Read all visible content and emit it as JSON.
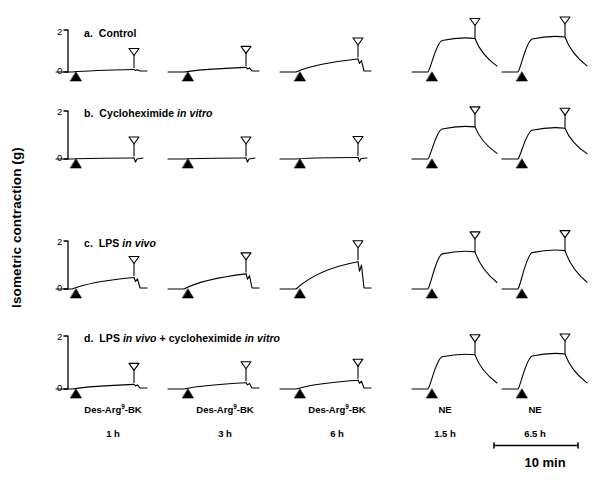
{
  "figure": {
    "axis_label": "Isometric contraction (g)",
    "axis_ticks": [
      "2",
      "0"
    ],
    "scale_bar_label": "10 min",
    "panels": [
      {
        "id": "a",
        "title_prefix": "a.",
        "title": "Control",
        "title_html": "a. &nbsp;Control"
      },
      {
        "id": "b",
        "title_prefix": "b.",
        "title": "Cycloheximide in vitro",
        "title_html": "b. &nbsp;Cycloheximide <span class=\"it\">in vitro</span>"
      },
      {
        "id": "c",
        "title_prefix": "c.",
        "title": "LPS in vivo",
        "title_html": "c. &nbsp;LPS <span class=\"it\">in vivo</span>"
      },
      {
        "id": "d",
        "title_prefix": "d.",
        "title": "LPS in vivo + cycloheximide in vitro",
        "title_html": "d. &nbsp;LPS <span class=\"it\">in vivo</span> + cycloheximide <span class=\"it\">in vitro</span>"
      }
    ],
    "columns": [
      {
        "agonist": "Des-Arg9-BK",
        "agonist_html": "Des-Arg<sup>9</sup>-BK",
        "time": "1 h"
      },
      {
        "agonist": "Des-Arg9-BK",
        "agonist_html": "Des-Arg<sup>9</sup>-BK",
        "time": "3 h"
      },
      {
        "agonist": "Des-Arg9-BK",
        "agonist_html": "Des-Arg<sup>9</sup>-BK",
        "time": "6 h"
      },
      {
        "agonist": "NE",
        "agonist_html": "NE",
        "time": "1.5 h"
      },
      {
        "agonist": "NE",
        "agonist_html": "NE",
        "time": "6.5 h"
      }
    ],
    "markers": {
      "addition": "filled-triangle-up",
      "washout": "open-triangle-down"
    },
    "trace_color": "#000000"
  },
  "chart_data": {
    "type": "line",
    "title": "",
    "ylabel": "Isometric contraction (g)",
    "xlabel": "",
    "ylim": [
      0,
      2
    ],
    "yticks": [
      0,
      2
    ],
    "grid": false,
    "legend": "none",
    "scale_bar": {
      "label": "10 min",
      "axis": "x"
    },
    "row_labels": [
      "a. Control",
      "b. Cycloheximide in vitro",
      "c. LPS in vivo",
      "d. LPS in vivo + cycloheximide in vitro"
    ],
    "column_labels": [
      "Des-Arg9-BK 1 h",
      "Des-Arg9-BK 3 h",
      "Des-Arg9-BK 6 h",
      "NE 1.5 h",
      "NE 6.5 h"
    ],
    "panels": [
      {
        "row": "a. Control",
        "traces": [
          {
            "column": "Des-Arg9-BK 1 h",
            "peak_g": 0.12,
            "shape": "slow-small-rise"
          },
          {
            "column": "Des-Arg9-BK 3 h",
            "peak_g": 0.22,
            "shape": "slow-small-rise"
          },
          {
            "column": "Des-Arg9-BK 6 h",
            "peak_g": 0.62,
            "shape": "slow-rise"
          },
          {
            "column": "NE 1.5 h",
            "peak_g": 1.55,
            "shape": "fast-rise-plateau-decay"
          },
          {
            "column": "NE 6.5 h",
            "peak_g": 1.62,
            "shape": "fast-rise-plateau-decay"
          }
        ]
      },
      {
        "row": "b. Cycloheximide in vitro",
        "traces": [
          {
            "column": "Des-Arg9-BK 1 h",
            "peak_g": 0.05,
            "shape": "flat"
          },
          {
            "column": "Des-Arg9-BK 3 h",
            "peak_g": 0.05,
            "shape": "flat"
          },
          {
            "column": "Des-Arg9-BK 6 h",
            "peak_g": 0.07,
            "shape": "flat"
          },
          {
            "column": "NE 1.5 h",
            "peak_g": 1.48,
            "shape": "fast-rise-plateau-decay"
          },
          {
            "column": "NE 6.5 h",
            "peak_g": 1.42,
            "shape": "fast-rise-plateau-decay"
          }
        ]
      },
      {
        "row": "c. LPS in vivo",
        "traces": [
          {
            "column": "Des-Arg9-BK 1 h",
            "peak_g": 0.55,
            "shape": "slow-rise"
          },
          {
            "column": "Des-Arg9-BK 3 h",
            "peak_g": 0.72,
            "shape": "slow-rise"
          },
          {
            "column": "Des-Arg9-BK 6 h",
            "peak_g": 1.3,
            "shape": "slow-large-rise"
          },
          {
            "column": "NE 1.5 h",
            "peak_g": 1.72,
            "shape": "fast-rise-plateau-decay"
          },
          {
            "column": "NE 6.5 h",
            "peak_g": 1.78,
            "shape": "fast-rise-plateau-decay"
          }
        ]
      },
      {
        "row": "d. LPS in vivo + cycloheximide in vitro",
        "traces": [
          {
            "column": "Des-Arg9-BK 1 h",
            "peak_g": 0.22,
            "shape": "slow-small-rise"
          },
          {
            "column": "Des-Arg9-BK 3 h",
            "peak_g": 0.3,
            "shape": "slow-small-rise"
          },
          {
            "column": "Des-Arg9-BK 6 h",
            "peak_g": 0.42,
            "shape": "slow-small-rise"
          },
          {
            "column": "NE 1.5 h",
            "peak_g": 1.58,
            "shape": "fast-rise-plateau-decay"
          },
          {
            "column": "NE 6.5 h",
            "peak_g": 1.62,
            "shape": "fast-rise-plateau-decay"
          }
        ]
      }
    ]
  }
}
